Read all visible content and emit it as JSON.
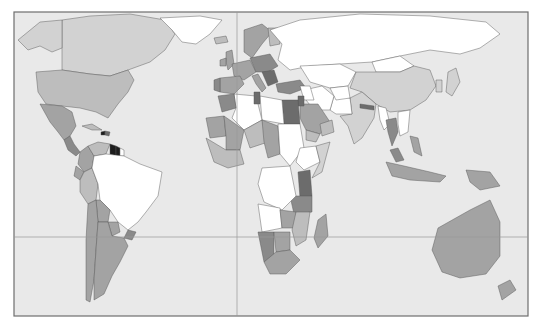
{
  "map": {
    "type": "choropleth-world-map",
    "title": "",
    "legend": null,
    "palette": {
      "ocean": "#e9e9e9",
      "no_data": "#ffffff",
      "level_1": "#d2d2d2",
      "level_2": "#bdbdbd",
      "level_3": "#a3a3a3",
      "level_4": "#8a8a8a",
      "level_5": "#6c6c6c",
      "level_6": "#1e1e1e"
    },
    "grid_lines": [
      "prime-meridian",
      "equator"
    ],
    "regions": [
      {
        "name": "Canada",
        "level": "level_1"
      },
      {
        "name": "Alaska",
        "level": "level_1"
      },
      {
        "name": "Greenland",
        "level": "no_data"
      },
      {
        "name": "United States",
        "level": "level_2"
      },
      {
        "name": "Mexico",
        "level": "level_3"
      },
      {
        "name": "Central America",
        "level": "level_4"
      },
      {
        "name": "Cuba",
        "level": "level_2"
      },
      {
        "name": "Haiti",
        "level": "level_6"
      },
      {
        "name": "Dominican Republic",
        "level": "level_5"
      },
      {
        "name": "Colombia",
        "level": "level_3"
      },
      {
        "name": "Venezuela",
        "level": "level_2"
      },
      {
        "name": "Guyana",
        "level": "level_6"
      },
      {
        "name": "Suriname",
        "level": "level_6"
      },
      {
        "name": "French Guiana",
        "level": "no_data"
      },
      {
        "name": "Ecuador",
        "level": "level_3"
      },
      {
        "name": "Peru",
        "level": "level_2"
      },
      {
        "name": "Brazil",
        "level": "no_data"
      },
      {
        "name": "Bolivia",
        "level": "level_3"
      },
      {
        "name": "Paraguay",
        "level": "level_3"
      },
      {
        "name": "Chile",
        "level": "level_3"
      },
      {
        "name": "Argentina",
        "level": "level_3"
      },
      {
        "name": "Uruguay",
        "level": "level_4"
      },
      {
        "name": "Iceland",
        "level": "level_2"
      },
      {
        "name": "United Kingdom",
        "level": "level_3"
      },
      {
        "name": "Ireland",
        "level": "level_3"
      },
      {
        "name": "Scandinavia",
        "level": "level_3"
      },
      {
        "name": "Finland",
        "level": "level_2"
      },
      {
        "name": "Western Europe",
        "level": "level_3"
      },
      {
        "name": "Central Europe",
        "level": "level_4"
      },
      {
        "name": "Balkans",
        "level": "level_5"
      },
      {
        "name": "Spain",
        "level": "level_3"
      },
      {
        "name": "Portugal",
        "level": "level_4"
      },
      {
        "name": "Italy",
        "level": "level_3"
      },
      {
        "name": "Turkey",
        "level": "level_4"
      },
      {
        "name": "Russia",
        "level": "no_data"
      },
      {
        "name": "Kazakhstan",
        "level": "no_data"
      },
      {
        "name": "Mongolia",
        "level": "no_data"
      },
      {
        "name": "China",
        "level": "level_1"
      },
      {
        "name": "Japan",
        "level": "level_1"
      },
      {
        "name": "Korea",
        "level": "level_1"
      },
      {
        "name": "India",
        "level": "level_1"
      },
      {
        "name": "Nepal",
        "level": "level_5"
      },
      {
        "name": "Pakistan",
        "level": "no_data"
      },
      {
        "name": "Afghanistan",
        "level": "no_data"
      },
      {
        "name": "Iran",
        "level": "no_data"
      },
      {
        "name": "Saudi Arabia",
        "level": "level_3"
      },
      {
        "name": "Yemen",
        "level": "level_2"
      },
      {
        "name": "Oman",
        "level": "level_2"
      },
      {
        "name": "Iraq",
        "level": "no_data"
      },
      {
        "name": "Jordan",
        "level": "level_5"
      },
      {
        "name": "Egypt",
        "level": "level_5"
      },
      {
        "name": "Libya",
        "level": "no_data"
      },
      {
        "name": "Algeria",
        "level": "no_data"
      },
      {
        "name": "Morocco",
        "level": "level_4"
      },
      {
        "name": "Tunisia",
        "level": "level_5"
      },
      {
        "name": "Mauritania",
        "level": "level_3"
      },
      {
        "name": "Mali",
        "level": "level_3"
      },
      {
        "name": "Niger",
        "level": "level_2"
      },
      {
        "name": "Chad",
        "level": "level_3"
      },
      {
        "name": "Sudan",
        "level": "no_data"
      },
      {
        "name": "Ethiopia",
        "level": "no_data"
      },
      {
        "name": "Somalia",
        "level": "level_1"
      },
      {
        "name": "Kenya",
        "level": "level_5"
      },
      {
        "name": "Tanzania",
        "level": "level_4"
      },
      {
        "name": "DR Congo",
        "level": "no_data"
      },
      {
        "name": "Angola",
        "level": "no_data"
      },
      {
        "name": "Zambia",
        "level": "level_3"
      },
      {
        "name": "Mozambique",
        "level": "level_2"
      },
      {
        "name": "Namibia",
        "level": "level_4"
      },
      {
        "name": "Botswana",
        "level": "level_3"
      },
      {
        "name": "South Africa",
        "level": "level_3"
      },
      {
        "name": "Madagascar",
        "level": "level_3"
      },
      {
        "name": "West Africa coast",
        "level": "level_2"
      },
      {
        "name": "Myanmar",
        "level": "no_data"
      },
      {
        "name": "Thailand",
        "level": "level_4"
      },
      {
        "name": "Vietnam",
        "level": "no_data"
      },
      {
        "name": "Malaysia",
        "level": "level_4"
      },
      {
        "name": "Philippines",
        "level": "level_3"
      },
      {
        "name": "Indonesia",
        "level": "level_3"
      },
      {
        "name": "Papua New Guinea",
        "level": "level_3"
      },
      {
        "name": "Australia",
        "level": "level_3"
      },
      {
        "name": "New Zealand",
        "level": "level_3"
      }
    ]
  }
}
